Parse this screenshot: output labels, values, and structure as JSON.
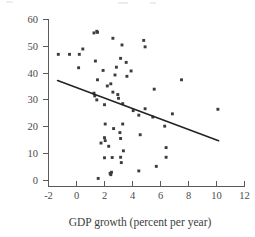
{
  "figure": {
    "background_color": "#ffffff",
    "point_color": "#3c3c3c",
    "line_color": "#232323",
    "axis_color": "#5a5a5a",
    "text_color": "#3d3d3d"
  },
  "axes": {
    "x_title": "GDP growth (percent per year)",
    "y_title": "",
    "x_ticks": [
      "-2",
      "0",
      "2",
      "4",
      "6",
      "8",
      "10",
      "12"
    ],
    "y_ticks": [
      "0",
      "10",
      "20",
      "30",
      "40",
      "50",
      "60"
    ]
  },
  "chart_data": {
    "type": "scatter",
    "title": "",
    "xlabel": "GDP growth (percent per year)",
    "ylabel": "",
    "xlim": [
      -2,
      12
    ],
    "ylim": [
      0,
      60
    ],
    "xticks": [
      -2,
      0,
      2,
      4,
      6,
      8,
      10,
      12
    ],
    "yticks": [
      0,
      10,
      20,
      30,
      40,
      50,
      60
    ],
    "grid": false,
    "legend": "none",
    "marker": "square",
    "points": [
      [
        -1.3,
        47.0
      ],
      [
        -0.5,
        47.0
      ],
      [
        0.2,
        47.0
      ],
      [
        0.45,
        49.0
      ],
      [
        0.15,
        42.0
      ],
      [
        1.25,
        55.0
      ],
      [
        1.45,
        55.6
      ],
      [
        1.5,
        55.2
      ],
      [
        1.35,
        44.5
      ],
      [
        2.6,
        53.0
      ],
      [
        3.25,
        50.5
      ],
      [
        3.15,
        45.5
      ],
      [
        4.8,
        52.2
      ],
      [
        4.9,
        49.8
      ],
      [
        3.55,
        44.0
      ],
      [
        2.85,
        42.2
      ],
      [
        3.9,
        40.8
      ],
      [
        1.9,
        41.0
      ],
      [
        1.5,
        37.5
      ],
      [
        2.75,
        39.3
      ],
      [
        2.2,
        35.2
      ],
      [
        2.45,
        36.0
      ],
      [
        3.6,
        38.8
      ],
      [
        5.55,
        34.0
      ],
      [
        7.5,
        37.5
      ],
      [
        1.25,
        32.5
      ],
      [
        1.3,
        31.5
      ],
      [
        1.45,
        30.0
      ],
      [
        2.0,
        28.2
      ],
      [
        2.95,
        32.0
      ],
      [
        3.0,
        30.6
      ],
      [
        3.3,
        28.6
      ],
      [
        2.6,
        32.9
      ],
      [
        4.05,
        26.0
      ],
      [
        4.9,
        26.7
      ],
      [
        4.45,
        24.3
      ],
      [
        5.45,
        23.6
      ],
      [
        6.85,
        24.8
      ],
      [
        10.1,
        26.5
      ],
      [
        2.05,
        21.0
      ],
      [
        3.3,
        21.0
      ],
      [
        2.65,
        19.3
      ],
      [
        3.1,
        17.8
      ],
      [
        6.3,
        20.2
      ],
      [
        4.55,
        17.0
      ],
      [
        2.0,
        15.9
      ],
      [
        2.05,
        14.8
      ],
      [
        3.15,
        15.6
      ],
      [
        1.75,
        13.9
      ],
      [
        2.3,
        12.7
      ],
      [
        6.4,
        12.2
      ],
      [
        3.35,
        11.0
      ],
      [
        2.0,
        8.4
      ],
      [
        2.55,
        8.5
      ],
      [
        3.15,
        8.6
      ],
      [
        6.4,
        8.6
      ],
      [
        3.2,
        6.6
      ],
      [
        4.45,
        3.5
      ],
      [
        5.7,
        5.2
      ],
      [
        2.4,
        2.6
      ],
      [
        2.45,
        2.1
      ],
      [
        2.5,
        3.0
      ],
      [
        1.55,
        0.7
      ]
    ],
    "trend_line": {
      "label": "fitted regression line",
      "x_start": -1.35,
      "y_start": 37.2,
      "x_end": 10.15,
      "y_end": 14.8
    }
  }
}
